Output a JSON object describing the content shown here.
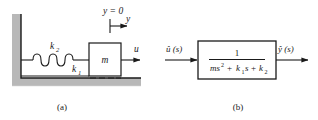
{
  "figure": {
    "panel_a": {
      "caption": "(a)",
      "labels": {
        "spring_upper": "k",
        "spring_upper_sub": "2",
        "spring_lower": "k",
        "spring_lower_sub": "1",
        "mass": "m",
        "force": "u",
        "datum": "y = 0",
        "coordinate": "y"
      },
      "colors": {
        "wall_fill": "#b8b8b8",
        "line": "#1a1a1a",
        "background": "#ffffff"
      }
    },
    "panel_b": {
      "caption": "(b)",
      "labels": {
        "input": "û (s)",
        "output": "ŷ (s)",
        "numerator": "1",
        "denominator_ms2": "ms",
        "denominator_ms2_exp": "2",
        "denominator_plus1": "+",
        "denominator_k1": "k",
        "denominator_k1_sub": "1",
        "denominator_k1_s": "s",
        "denominator_plus2": "+",
        "denominator_k2": "k",
        "denominator_k2_sub": "2"
      },
      "transfer_function": "1 / (ms^2 + k1*s + k2)",
      "colors": {
        "box_stroke": "#1a1a1a",
        "background": "#ffffff"
      }
    }
  }
}
